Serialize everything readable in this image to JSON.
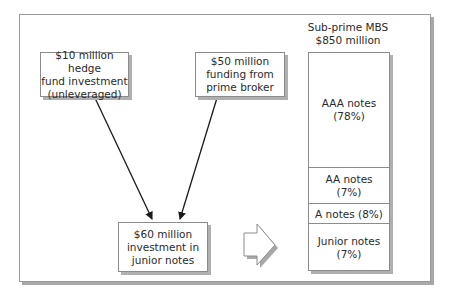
{
  "diagram": {
    "sources": [
      {
        "id": "hedge-fund",
        "lines": [
          "$10 million hedge",
          "fund investment",
          "(unleveraged)"
        ]
      },
      {
        "id": "prime-broker",
        "lines": [
          "$50 million",
          "funding from",
          "prime broker"
        ]
      }
    ],
    "target": {
      "id": "junior-investment",
      "lines": [
        "$60 million",
        "investment in",
        "junior notes"
      ]
    },
    "mbs": {
      "title_lines": [
        "Sub-prime MBS",
        "$850 million"
      ],
      "tranches": [
        {
          "name": "AAA notes",
          "pct": "(78%)",
          "label_lines": [
            "AAA notes",
            "(78%)"
          ]
        },
        {
          "name": "AA notes",
          "pct": "(7%)",
          "label_lines": [
            "AA notes",
            "(7%)"
          ]
        },
        {
          "name": "A notes",
          "pct": "(8%)",
          "label_lines": [
            "A notes (8%)"
          ]
        },
        {
          "name": "Junior notes",
          "pct": "(7%)",
          "label_lines": [
            "Junior notes",
            "(7%)"
          ]
        }
      ]
    },
    "colors": {
      "border": "#8c8c8c",
      "shadow": "#b0b0b0",
      "text": "#2a2a2a",
      "arrow": "#1a1a1a"
    }
  }
}
